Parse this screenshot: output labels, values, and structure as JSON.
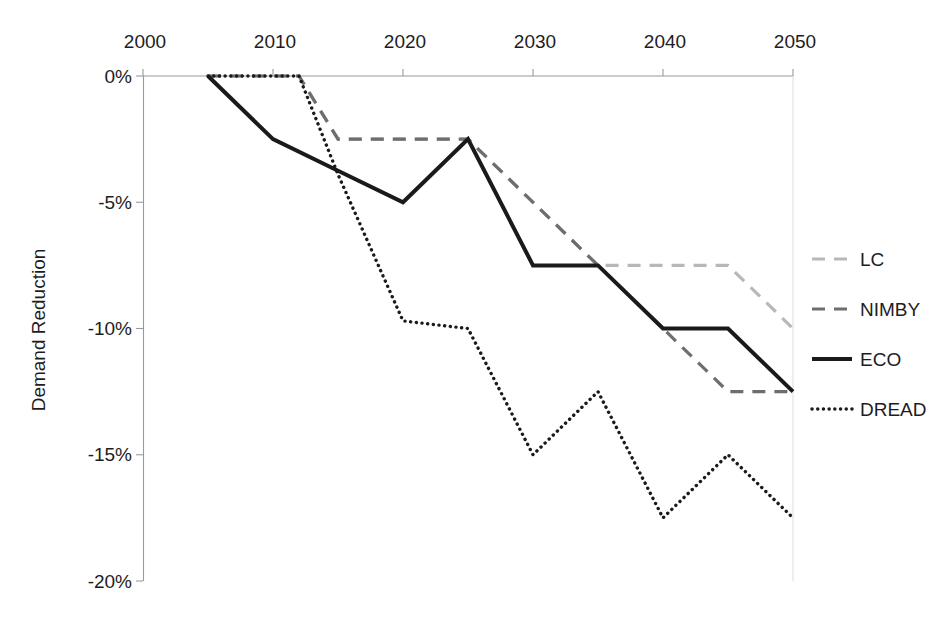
{
  "chart_data": {
    "type": "line",
    "title": "",
    "subtitle": "",
    "xlabel": "",
    "ylabel": "Demand Reduction",
    "x": [
      2000,
      2005,
      2010,
      2012,
      2015,
      2020,
      2025,
      2030,
      2035,
      2040,
      2045,
      2050
    ],
    "xlim": [
      2000,
      2050
    ],
    "ylim": [
      -20,
      0
    ],
    "x_tick_labels": [
      "2000",
      "2010",
      "2020",
      "2030",
      "2040",
      "2050"
    ],
    "x_ticks": [
      2000,
      2010,
      2020,
      2030,
      2040,
      2050
    ],
    "x_axis_position": "top",
    "y_tick_labels": [
      "0%",
      "-5%",
      "-10%",
      "-15%",
      "-20%"
    ],
    "y_ticks": [
      0,
      -5,
      -10,
      -15,
      -20
    ],
    "grid": false,
    "legend_position": "right",
    "series": [
      {
        "name": "LC",
        "style": "dashed",
        "color": "#b8b8b8",
        "x": [
          2005,
          2012,
          2015,
          2025,
          2035,
          2045,
          2050
        ],
        "values": [
          0,
          0,
          -2.5,
          -2.5,
          -7.5,
          -7.5,
          -10
        ]
      },
      {
        "name": "NIMBY",
        "style": "dashed",
        "color": "#6e6e6e",
        "x": [
          2005,
          2012,
          2015,
          2025,
          2035,
          2045,
          2050
        ],
        "values": [
          0,
          0,
          -2.5,
          -2.5,
          -7.5,
          -12.5,
          -12.5
        ]
      },
      {
        "name": "ECO",
        "style": "solid",
        "color": "#1a1a1a",
        "x": [
          2005,
          2010,
          2015,
          2020,
          2025,
          2030,
          2035,
          2040,
          2045,
          2050
        ],
        "values": [
          0,
          -2.5,
          -3.75,
          -5,
          -2.5,
          -7.5,
          -7.5,
          -10,
          -10,
          -12.5
        ]
      },
      {
        "name": "DREAD",
        "style": "dotted",
        "color": "#1a1a1a",
        "x": [
          2005,
          2012,
          2015,
          2020,
          2025,
          2030,
          2035,
          2040,
          2045,
          2050
        ],
        "values": [
          0,
          0,
          -3.9,
          -9.7,
          -10,
          -15,
          -12.5,
          -17.5,
          -15,
          -17.5
        ]
      }
    ]
  },
  "axes": {
    "y_title": "Demand Reduction",
    "y_tick_0": "0%",
    "y_tick_1": "-5%",
    "y_tick_2": "-10%",
    "y_tick_3": "-15%",
    "y_tick_4": "-20%",
    "x_tick_0": "2000",
    "x_tick_1": "2010",
    "x_tick_2": "2020",
    "x_tick_3": "2030",
    "x_tick_4": "2040",
    "x_tick_5": "2050"
  },
  "legend": {
    "items": [
      {
        "label": "LC"
      },
      {
        "label": "NIMBY"
      },
      {
        "label": "ECO"
      },
      {
        "label": "DREAD"
      }
    ]
  },
  "colors": {
    "lc": "#b8b8b8",
    "nimby": "#6e6e6e",
    "eco": "#1a1a1a",
    "dread": "#1a1a1a",
    "axis": "#9a9a9a",
    "text": "#1d1d1d",
    "background": "#ffffff"
  }
}
